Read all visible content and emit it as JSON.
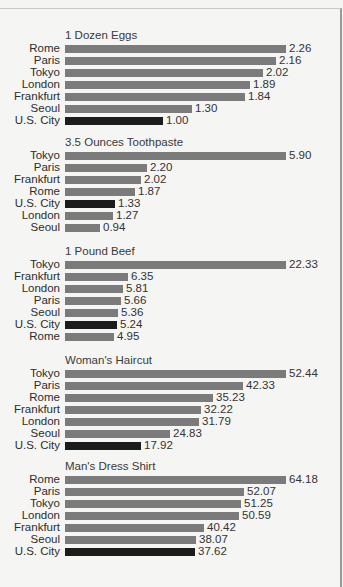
{
  "chart_data": [
    {
      "type": "bar",
      "orientation": "horizontal",
      "title": "1 Dozen Eggs",
      "categories": [
        "Rome",
        "Paris",
        "Tokyo",
        "London",
        "Frankfurt",
        "Seoul",
        "U.S. City"
      ],
      "values": [
        2.26,
        2.16,
        2.02,
        1.89,
        1.84,
        1.3,
        1.0
      ],
      "labels": [
        "2.26",
        "2.16",
        "2.02",
        "1.89",
        "1.84",
        "1.30",
        "1.00"
      ],
      "highlight": "U.S. City",
      "xlabel": "",
      "ylabel": "",
      "grid": false
    },
    {
      "type": "bar",
      "orientation": "horizontal",
      "title": "3.5 Ounces Toothpaste",
      "categories": [
        "Tokyo",
        "Paris",
        "Frankfurt",
        "Rome",
        "U.S. City",
        "London",
        "Seoul"
      ],
      "values": [
        5.9,
        2.2,
        2.02,
        1.87,
        1.33,
        1.27,
        0.94
      ],
      "labels": [
        "5.90",
        "2.20",
        "2.02",
        "1.87",
        "1.33",
        "1.27",
        "0.94"
      ],
      "highlight": "U.S. City",
      "xlabel": "",
      "ylabel": "",
      "grid": false
    },
    {
      "type": "bar",
      "orientation": "horizontal",
      "title": "1 Pound Beef",
      "categories": [
        "Tokyo",
        "Frankfurt",
        "London",
        "Paris",
        "Seoul",
        "U.S. City",
        "Rome"
      ],
      "values": [
        22.33,
        6.35,
        5.81,
        5.66,
        5.36,
        5.24,
        4.95
      ],
      "labels": [
        "22.33",
        "6.35",
        "5.81",
        "5.66",
        "5.36",
        "5.24",
        "4.95"
      ],
      "highlight": "U.S. City",
      "xlabel": "",
      "ylabel": "",
      "grid": false
    },
    {
      "type": "bar",
      "orientation": "horizontal",
      "title": "Woman's Haircut",
      "categories": [
        "Tokyo",
        "Paris",
        "Rome",
        "Frankfurt",
        "London",
        "Seoul",
        "U.S. City"
      ],
      "values": [
        52.44,
        42.33,
        35.23,
        32.22,
        31.79,
        24.83,
        17.92
      ],
      "labels": [
        "52.44",
        "42.33",
        "35.23",
        "32.22",
        "31.79",
        "24.83",
        "17.92"
      ],
      "highlight": "U.S. City",
      "xlabel": "",
      "ylabel": "",
      "grid": false
    },
    {
      "type": "bar",
      "orientation": "horizontal",
      "title": "Man's Dress Shirt",
      "categories": [
        "Rome",
        "Paris",
        "Tokyo",
        "London",
        "Frankfurt",
        "Seoul",
        "U.S. City"
      ],
      "values": [
        64.18,
        52.07,
        51.25,
        50.59,
        40.42,
        38.07,
        37.62
      ],
      "labels": [
        "64.18",
        "52.07",
        "51.25",
        "50.59",
        "40.42",
        "38.07",
        "37.62"
      ],
      "highlight": "U.S. City",
      "xlabel": "",
      "ylabel": "",
      "grid": false
    }
  ],
  "colors": {
    "bar": "#7b7b7b",
    "highlight_bar": "#1c1c1c",
    "background": "#f5f5f3"
  },
  "layout": {
    "panel_tops": [
      29,
      136,
      245,
      354,
      460
    ],
    "bar_max_width": 221,
    "row_pitch": 12,
    "title_to_first_row": 14
  }
}
